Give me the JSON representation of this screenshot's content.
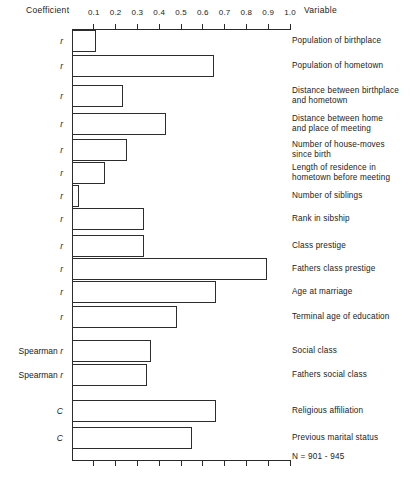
{
  "header": {
    "coefficient": "Coefficient",
    "variable": "Variable"
  },
  "axis": {
    "ticks": [
      "0.1",
      "0.2",
      "0.3",
      "0.4",
      "0.5",
      "0.6",
      "0.7",
      "0.8",
      "0.9",
      "1.0"
    ],
    "min": 0,
    "max": 1.0
  },
  "note": "N = 901 - 945",
  "chart_data": {
    "type": "bar",
    "orientation": "horizontal",
    "title": "",
    "xlabel": "Coefficient",
    "ylabel": "Variable",
    "xlim": [
      0,
      1.0
    ],
    "grid": false,
    "legend": "none",
    "tick_labels": [
      "0.1",
      "0.2",
      "0.3",
      "0.4",
      "0.5",
      "0.6",
      "0.7",
      "0.8",
      "0.9",
      "1.0"
    ],
    "annotations": [
      "N = 901 - 945"
    ],
    "groups": [
      {
        "name": "pearson-r",
        "coefficient": "r",
        "categories": [
          "Population of birthplace",
          "Population of hometown",
          "Distance between birthplace\nand hometown",
          "Distance between home\nand place of meeting",
          "Number of house-moves\nsince birth",
          "Length of residence in\nhometown before meeting",
          "Number of siblings",
          "Rank in sibship",
          "Class prestige",
          "Fathers class prestige",
          "Age at marriage",
          "Terminal age of education"
        ],
        "values": [
          0.11,
          0.65,
          0.23,
          0.43,
          0.25,
          0.15,
          0.03,
          0.33,
          0.33,
          0.89,
          0.66,
          0.48
        ]
      },
      {
        "name": "spearman-r",
        "coefficient": "Spearman r",
        "categories": [
          "Social class",
          "Fathers social class"
        ],
        "values": [
          0.36,
          0.34
        ]
      },
      {
        "name": "contingency-c",
        "coefficient": "C",
        "categories": [
          "Religious affiliation",
          "Previous marital status"
        ],
        "values": [
          0.66,
          0.55
        ]
      }
    ]
  },
  "colors": {
    "ink": "#2d2d2d",
    "bar_fill": "#ffffff",
    "background": "#ffffff"
  }
}
